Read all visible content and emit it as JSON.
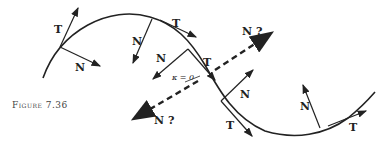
{
  "figure": {
    "caption": "Figure 7.36",
    "labels": {
      "tangent": "T",
      "normal": "N",
      "normal_question": "N ?",
      "curvature_zero": "κ = 0"
    }
  }
}
